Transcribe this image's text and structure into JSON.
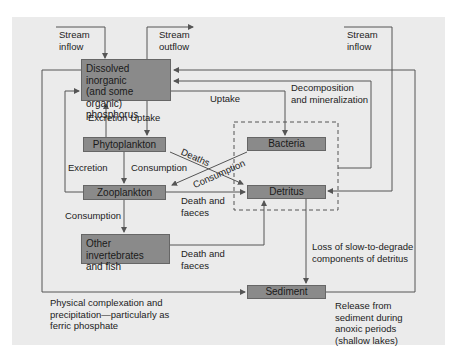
{
  "diagram": {
    "colors": {
      "panel": "#ebebeb",
      "box": "#8a8a8a",
      "line": "#555555"
    },
    "nodes": {
      "dissolved": "Dissolved inorganic\n(and some organic)\nphosphorus",
      "phytoplankton": "Phytoplankton",
      "zooplankton": "Zooplankton",
      "invertebrates": "Other invertebrates\nand fish",
      "bacteria": "Bacteria",
      "detritus": "Detritus",
      "sediment": "Sediment"
    },
    "labels": {
      "stream_inflow_left": "Stream\ninflow",
      "stream_outflow": "Stream\noutflow",
      "stream_inflow_right": "Stream\ninflow",
      "excretion_uptake": "Excretion Uptake",
      "uptake": "Uptake",
      "decomposition": "Decomposition\nand mineralization",
      "excretion": "Excretion",
      "consumption_phyto": "Consumption",
      "deaths": "Deaths",
      "consumption_bacteria": "Consumption",
      "death_faeces_zoo": "Death and\nfaeces",
      "consumption_zoo": "Consumption",
      "death_faeces_inv": "Death and\nfaeces",
      "loss_slow": "Loss of slow-to-degrade\ncomponents of detritus",
      "physical_complexation": "Physical complexation and\nprecipitation—particularly as\nferric phosphate",
      "release_sediment": "Release from\nsediment during\nanoxic periods\n(shallow lakes)"
    }
  }
}
